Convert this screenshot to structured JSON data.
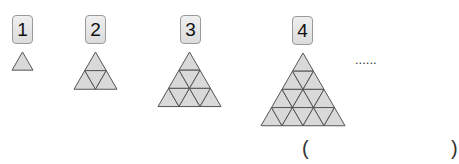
{
  "figures": [
    {
      "label": "1",
      "rows": 1,
      "box": {
        "x": 12,
        "y": 15
      },
      "apex": [
        22.5,
        52
      ],
      "size": 21
    },
    {
      "label": "2",
      "rows": 2,
      "box": {
        "x": 85,
        "y": 15
      },
      "apex": [
        95.5,
        52
      ],
      "size": 43
    },
    {
      "label": "3",
      "rows": 3,
      "box": {
        "x": 180,
        "y": 15
      },
      "apex": [
        189.5,
        52
      ],
      "size": 63
    },
    {
      "label": "4",
      "rows": 4,
      "box": {
        "x": 292,
        "y": 16
      },
      "apex": [
        303,
        53
      ],
      "size": 84
    }
  ],
  "ellipsis": "......",
  "answer": {
    "open": "(",
    "close": ")"
  },
  "colors": {
    "fill": "#d9d9d9",
    "stroke": "#555555"
  }
}
